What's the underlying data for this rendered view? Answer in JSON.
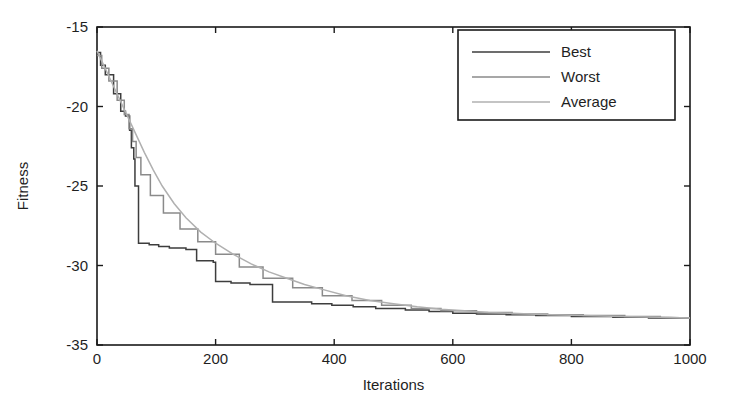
{
  "chart_data": {
    "type": "line",
    "title": "",
    "xlabel": "Iterations",
    "ylabel": "Fitness",
    "xlim": [
      0,
      1000
    ],
    "ylim": [
      -35,
      -15
    ],
    "xticks": [
      0,
      200,
      400,
      600,
      800,
      1000
    ],
    "xtick_labels": [
      "0",
      "200",
      "400",
      "600",
      "800",
      "1000"
    ],
    "yticks": [
      -35,
      -30,
      -25,
      -20,
      -15
    ],
    "ytick_labels": [
      "-35",
      "-30",
      "-25",
      "-20",
      "-15"
    ],
    "grid": false,
    "legend_position": "upper right",
    "series": [
      {
        "name": "Best",
        "color": "#3d3d3d",
        "style": "step",
        "x": [
          0,
          6,
          6,
          14,
          14,
          28,
          28,
          40,
          40,
          48,
          48,
          55,
          55,
          58,
          58,
          62,
          62,
          64,
          64,
          70,
          70,
          88,
          88,
          104,
          104,
          122,
          122,
          150,
          150,
          168,
          168,
          196,
          196,
          200,
          200,
          226,
          226,
          258,
          258,
          296,
          296,
          362,
          362,
          396,
          396,
          432,
          432,
          470,
          470,
          520,
          520,
          560,
          560,
          600,
          600,
          640,
          640,
          690,
          690,
          740,
          740,
          800,
          800,
          870,
          870,
          930,
          930,
          1000
        ],
        "y": [
          -16.6,
          -16.6,
          -17.4,
          -17.4,
          -18.0,
          -18.0,
          -19.2,
          -19.2,
          -20.3,
          -20.3,
          -20.6,
          -20.6,
          -21.5,
          -21.5,
          -22.6,
          -22.6,
          -23.3,
          -23.3,
          -25.0,
          -25.0,
          -28.6,
          -28.6,
          -28.7,
          -28.7,
          -28.8,
          -28.8,
          -28.9,
          -28.9,
          -29.0,
          -29.0,
          -29.7,
          -29.7,
          -29.8,
          -29.8,
          -31.0,
          -31.0,
          -31.1,
          -31.1,
          -31.2,
          -31.2,
          -32.3,
          -32.3,
          -32.4,
          -32.4,
          -32.5,
          -32.5,
          -32.6,
          -32.6,
          -32.7,
          -32.7,
          -32.8,
          -32.8,
          -32.9,
          -32.9,
          -33.0,
          -33.0,
          -33.05,
          -33.05,
          -33.1,
          -33.1,
          -33.15,
          -33.15,
          -33.2,
          -33.2,
          -33.25,
          -33.25,
          -33.3,
          -33.3
        ]
      },
      {
        "name": "Worst",
        "color": "#8a8a8a",
        "style": "step",
        "x": [
          0,
          8,
          8,
          20,
          20,
          34,
          34,
          46,
          46,
          54,
          54,
          60,
          60,
          66,
          66,
          74,
          74,
          90,
          90,
          112,
          112,
          140,
          140,
          170,
          170,
          200,
          200,
          240,
          240,
          280,
          280,
          330,
          330,
          380,
          380,
          430,
          430,
          480,
          480,
          530,
          530,
          580,
          580,
          640,
          640,
          700,
          700,
          760,
          760,
          820,
          820,
          890,
          890,
          950,
          950,
          1000
        ],
        "y": [
          -16.8,
          -16.8,
          -17.6,
          -17.6,
          -18.4,
          -18.4,
          -19.6,
          -19.6,
          -20.5,
          -20.5,
          -21.4,
          -21.4,
          -22.2,
          -22.2,
          -23.2,
          -23.2,
          -24.3,
          -24.3,
          -25.6,
          -25.6,
          -26.7,
          -26.7,
          -27.7,
          -27.7,
          -28.5,
          -28.5,
          -29.3,
          -29.3,
          -30.1,
          -30.1,
          -30.8,
          -30.8,
          -31.4,
          -31.4,
          -31.9,
          -31.9,
          -32.2,
          -32.2,
          -32.5,
          -32.5,
          -32.7,
          -32.7,
          -32.85,
          -32.85,
          -32.95,
          -32.95,
          -33.05,
          -33.05,
          -33.1,
          -33.1,
          -33.15,
          -33.15,
          -33.2,
          -33.2,
          -33.25,
          -33.3
        ]
      },
      {
        "name": "Average",
        "color": "#b0b0b0",
        "style": "smooth",
        "x": [
          0,
          10,
          20,
          30,
          40,
          50,
          60,
          70,
          80,
          95,
          110,
          130,
          150,
          175,
          200,
          230,
          260,
          290,
          320,
          350,
          380,
          420,
          460,
          500,
          540,
          580,
          620,
          660,
          700,
          750,
          800,
          850,
          900,
          950,
          1000
        ],
        "y": [
          -16.5,
          -17.3,
          -18.1,
          -18.9,
          -19.7,
          -20.5,
          -21.3,
          -22.1,
          -22.9,
          -24.0,
          -25.0,
          -26.1,
          -27.0,
          -27.9,
          -28.6,
          -29.3,
          -29.9,
          -30.4,
          -30.8,
          -31.2,
          -31.5,
          -31.9,
          -32.2,
          -32.4,
          -32.6,
          -32.75,
          -32.85,
          -32.95,
          -33.0,
          -33.08,
          -33.13,
          -33.18,
          -33.22,
          -33.26,
          -33.3
        ]
      }
    ],
    "legend_entries": [
      {
        "label": "Best",
        "color": "#3d3d3d"
      },
      {
        "label": "Worst",
        "color": "#8a8a8a"
      },
      {
        "label": "Average",
        "color": "#b0b0b0"
      }
    ],
    "axis_color": "#1a1a1a",
    "background": "#ffffff"
  },
  "plot_geometry": {
    "left": 97,
    "right": 690,
    "top": 27,
    "bottom": 345
  }
}
